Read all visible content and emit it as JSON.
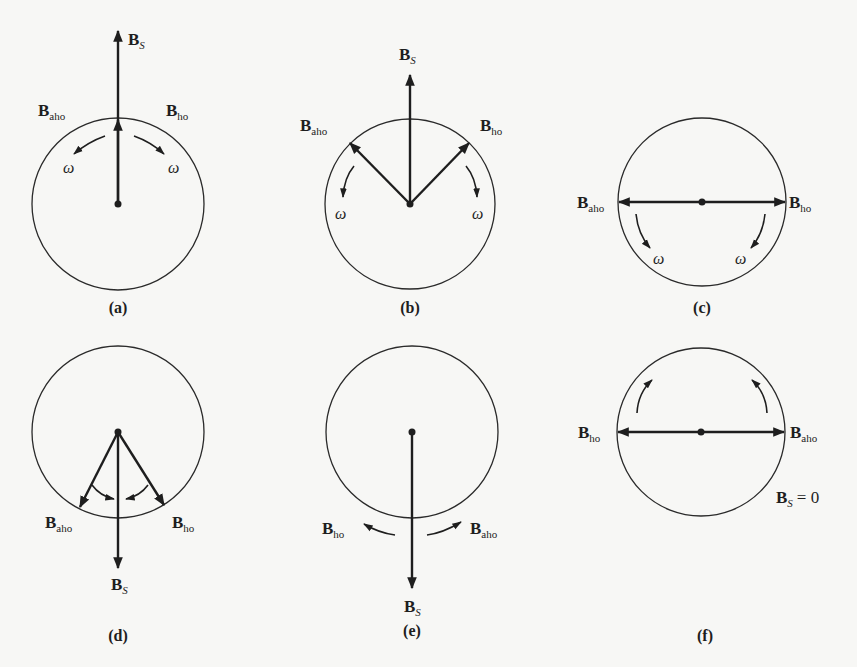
{
  "figure": {
    "symbols": {
      "B": "B",
      "stator_sub": "S",
      "ccw_sub": "aho",
      "cw_sub": "ho",
      "omega": "ω",
      "zero_eq": "= 0"
    },
    "panels": [
      {
        "id": "a",
        "caption": "(a)",
        "bs_direction": "up",
        "bs_magnitude": "max"
      },
      {
        "id": "b",
        "caption": "(b)",
        "bs_direction": "up",
        "bs_magnitude": "reduced"
      },
      {
        "id": "c",
        "caption": "(c)",
        "bs_direction": "none",
        "bs_magnitude": "zero"
      },
      {
        "id": "d",
        "caption": "(d)",
        "bs_direction": "down",
        "bs_magnitude": "reduced"
      },
      {
        "id": "e",
        "caption": "(e)",
        "bs_direction": "down",
        "bs_magnitude": "max"
      },
      {
        "id": "f",
        "caption": "(f)",
        "bs_direction": "none",
        "bs_magnitude": "zero",
        "note": "B_S = 0"
      }
    ]
  },
  "colors": {
    "background": "#f7f7f5",
    "ink": "#1e1e1e"
  }
}
